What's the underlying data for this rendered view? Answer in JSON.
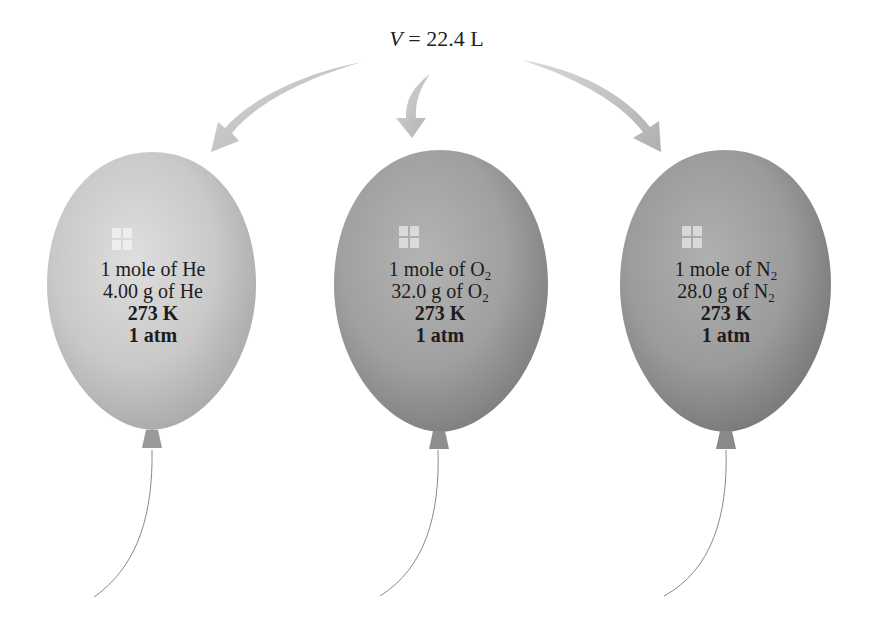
{
  "figure": {
    "volume_label": {
      "variable": "V",
      "equals": " = ",
      "value": "22.4 L"
    },
    "arrows": [
      {
        "name": "arrow-to-helium",
        "direction": "down-left",
        "color": "#b8b8b8"
      },
      {
        "name": "arrow-to-oxygen",
        "direction": "down",
        "color": "#b8b8b8"
      },
      {
        "name": "arrow-to-nitrogen",
        "direction": "down-right",
        "color": "#b8b8b8"
      }
    ],
    "balloons": [
      {
        "gas": "He",
        "color": "#c9c9c9",
        "color_dark": "#a9a9a9",
        "line1_prefix": "1 mole of He",
        "line1_sub": "",
        "line2_prefix": "4.00 g of He",
        "line2_sub": "",
        "temperature": "273 K",
        "pressure": "1 atm"
      },
      {
        "gas": "O2",
        "color": "#a3a3a3",
        "color_dark": "#808080",
        "line1_prefix": "1 mole of O",
        "line1_sub": "2",
        "line2_prefix": "32.0 g of O",
        "line2_sub": "2",
        "temperature": "273 K",
        "pressure": "1 atm"
      },
      {
        "gas": "N2",
        "color": "#9e9e9e",
        "color_dark": "#7b7b7b",
        "line1_prefix": "1 mole of N",
        "line1_sub": "2",
        "line2_prefix": "28.0 g of N",
        "line2_sub": "2",
        "temperature": "273 K",
        "pressure": "1 atm"
      }
    ]
  }
}
